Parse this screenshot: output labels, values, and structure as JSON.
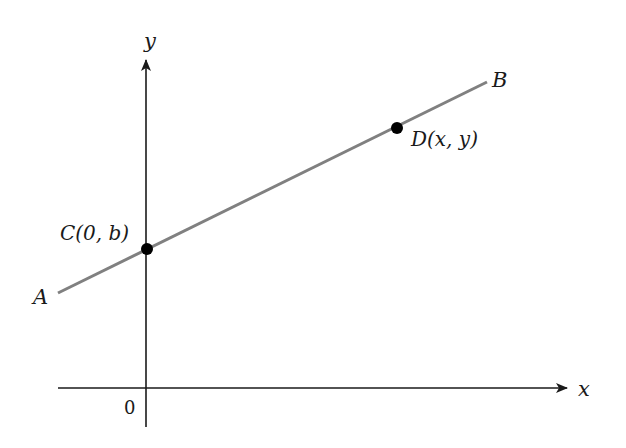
{
  "diagram": {
    "type": "coordinate-plane-line",
    "axes": {
      "x_label": "x",
      "y_label": "y",
      "origin_label": "0",
      "axis_color": "#1a1a1a"
    },
    "line": {
      "start_label": "A",
      "end_label": "B",
      "color": "#808080"
    },
    "points": [
      {
        "id": "C",
        "label": "C(0, b)",
        "name": "C",
        "coords": "(0, b)",
        "description": "y-intercept"
      },
      {
        "id": "D",
        "label": "D(x, y)",
        "name": "D",
        "coords": "(x, y)",
        "description": "general point on line"
      }
    ],
    "point_color": "#000000"
  }
}
